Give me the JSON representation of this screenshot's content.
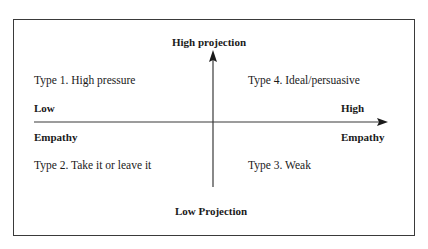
{
  "diagram": {
    "axes": {
      "vertical": {
        "top_label": "High projection",
        "bottom_label": "Low Projection"
      },
      "horizontal": {
        "left_label_line1": "Low",
        "left_label_line2": "Empathy",
        "right_label_line1": "High",
        "right_label_line2": "Empathy"
      }
    },
    "quadrants": [
      {
        "id": "type-1",
        "position": "top-left",
        "label": "Type 1. High pressure"
      },
      {
        "id": "type-4",
        "position": "top-right",
        "label": "Type 4. Ideal/persuasive"
      },
      {
        "id": "type-2",
        "position": "bottom-left",
        "label": "Type 2. Take it or leave it"
      },
      {
        "id": "type-3",
        "position": "bottom-right",
        "label": "Type 3. Weak"
      }
    ],
    "colors": {
      "line": "#3a3a3a",
      "text": "#1a1a1a",
      "background": "#ffffff"
    }
  }
}
